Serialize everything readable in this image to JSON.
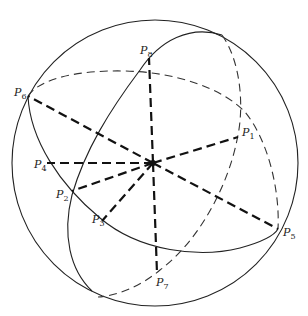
{
  "diagram": {
    "title": "",
    "center": {
      "x": 153,
      "y": 163
    },
    "sphere": {
      "cx": 155,
      "cy": 163,
      "r": 143
    },
    "points": [
      {
        "id": "P1",
        "base": "P",
        "sub": "1",
        "x": 238,
        "y": 137,
        "label_x": 242,
        "label_y": 136
      },
      {
        "id": "P2",
        "base": "P",
        "sub": "2",
        "x": 72,
        "y": 191,
        "label_x": 56,
        "label_y": 198
      },
      {
        "id": "P3",
        "base": "P",
        "sub": "3",
        "x": 102,
        "y": 221,
        "label_x": 92,
        "label_y": 223
      },
      {
        "id": "P4",
        "base": "P",
        "sub": "4",
        "x": 47,
        "y": 163,
        "label_x": 34,
        "label_y": 168
      },
      {
        "id": "P5",
        "base": "P",
        "sub": "5",
        "x": 278,
        "y": 229,
        "label_x": 283,
        "label_y": 236
      },
      {
        "id": "P6",
        "base": "P",
        "sub": "6",
        "x": 28,
        "y": 96,
        "label_x": 14,
        "label_y": 96
      },
      {
        "id": "P7",
        "base": "P",
        "sub": "7",
        "x": 157,
        "y": 273,
        "label_x": 156,
        "label_y": 286
      },
      {
        "id": "P8",
        "base": "P",
        "sub": "8",
        "x": 149,
        "y": 58,
        "label_x": 140,
        "label_y": 54
      }
    ]
  }
}
